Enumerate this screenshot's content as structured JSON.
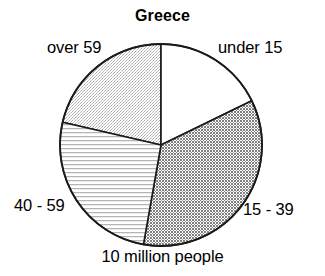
{
  "chart_data": {
    "type": "pie",
    "title": "Greece",
    "caption": "10 million people",
    "total_label": "10 million people",
    "xlabel": "",
    "ylabel": "",
    "grid": false,
    "legend_position": "outside-labels",
    "start_angle_deg": 0,
    "direction": "clockwise",
    "center": {
      "x": 161,
      "y": 145,
      "r": 101
    },
    "categories": [
      "under 15",
      "15 - 39",
      "40 - 59",
      "over 59"
    ],
    "values": [
      17.8,
      35.0,
      25.8,
      21.4
    ],
    "slices": [
      {
        "label": "under 15",
        "value": 17.8,
        "start_deg": 0,
        "end_deg": 64,
        "fill": "white",
        "fill_hex": "#ffffff",
        "label_position": "top-right"
      },
      {
        "label": "15 - 39",
        "value": 35.0,
        "start_deg": 64,
        "end_deg": 190,
        "fill": "dark-checkered",
        "fill_hex": "#a8a8a8",
        "label_position": "bottom-right"
      },
      {
        "label": "40 - 59",
        "value": 25.8,
        "start_deg": 190,
        "end_deg": 283,
        "fill": "horizontal-lines",
        "fill_hex": "#e8e8e8",
        "label_position": "bottom-left"
      },
      {
        "label": "over 59",
        "value": 21.4,
        "start_deg": 283,
        "end_deg": 360,
        "fill": "light-stipple",
        "fill_hex": "#dcdcdc",
        "label_position": "top-left"
      }
    ],
    "outline_hex": "#000000"
  },
  "labels": {
    "under_15": "under 15",
    "age_15_39": "15 - 39",
    "age_40_59": "40 - 59",
    "over_59": "over 59"
  }
}
